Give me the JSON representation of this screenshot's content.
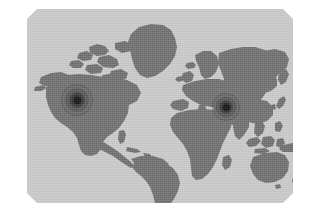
{
  "panel": {
    "title": "World Map",
    "corner_style": "chamfered",
    "background_color": "#c9c9c9",
    "land_color": "#6e6e6e",
    "ocean_color": "#c9c9c9",
    "page_background_color": "#ffffff"
  },
  "map": {
    "projection": "equirectangular",
    "antarctica_visible": false,
    "regions": [
      {
        "name": "north-america",
        "label": "North America"
      },
      {
        "name": "greenland",
        "label": "Greenland"
      },
      {
        "name": "canadian-arctic",
        "label": "Canadian Arctic Archipelago"
      },
      {
        "name": "south-america",
        "label": "South America"
      },
      {
        "name": "europe",
        "label": "Europe"
      },
      {
        "name": "africa",
        "label": "Africa"
      },
      {
        "name": "asia",
        "label": "Asia"
      },
      {
        "name": "australia",
        "label": "Australia"
      },
      {
        "name": "new-zealand",
        "label": "New Zealand"
      },
      {
        "name": "indonesia",
        "label": "Indonesia"
      },
      {
        "name": "japan",
        "label": "Japan"
      },
      {
        "name": "british-isles",
        "label": "British Isles"
      },
      {
        "name": "madagascar",
        "label": "Madagascar"
      },
      {
        "name": "iceland",
        "label": "Iceland"
      }
    ]
  },
  "hotspots": [
    {
      "name": "hotspot-north-america",
      "label": "United States",
      "x_px": 77,
      "y_px": 100,
      "radius_px": 17,
      "color": "#121212"
    },
    {
      "name": "hotspot-east-asia",
      "label": "East Asia",
      "x_px": 226,
      "y_px": 107,
      "radius_px": 15,
      "color": "#121212"
    }
  ]
}
